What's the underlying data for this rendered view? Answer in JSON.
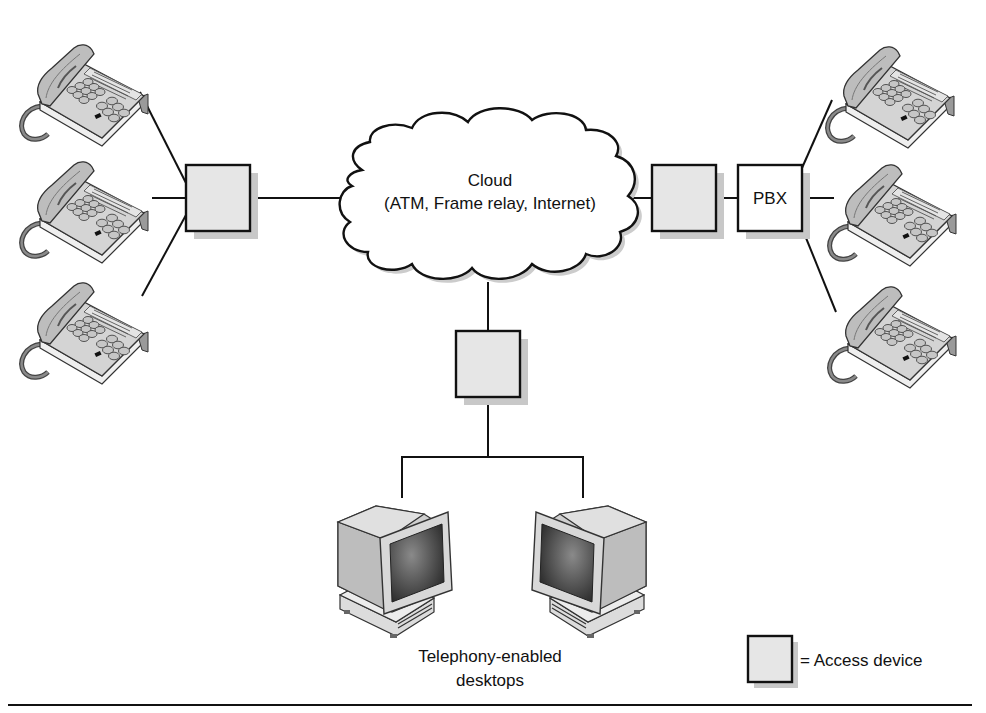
{
  "figure": {
    "cloud": {
      "title": "Cloud",
      "subtitle": "(ATM, Frame relay, Internet)"
    },
    "pbx": {
      "label": "PBX"
    },
    "desktops_caption": {
      "line1": "Telephony-enabled",
      "line2": "desktops"
    },
    "legend": {
      "symbol": "access-device-box",
      "text": "= Access device"
    },
    "left_group": {
      "phones": [
        {
          "name": "phone-1",
          "icon": "telephone-icon"
        },
        {
          "name": "phone-2",
          "icon": "telephone-icon"
        },
        {
          "name": "phone-3",
          "icon": "telephone-icon"
        }
      ],
      "access_device": "access-device"
    },
    "right_group": {
      "phones": [
        {
          "name": "phone-1",
          "icon": "telephone-icon"
        },
        {
          "name": "phone-2",
          "icon": "telephone-icon"
        },
        {
          "name": "phone-3",
          "icon": "telephone-icon"
        }
      ],
      "access_device": "access-device",
      "switch": "PBX"
    },
    "bottom_group": {
      "access_device": "access-device",
      "desktops": [
        {
          "name": "desktop-1",
          "icon": "computer-icon"
        },
        {
          "name": "desktop-2",
          "icon": "computer-icon"
        }
      ]
    },
    "colors": {
      "line": "#111111",
      "access_device_fill": "#e6e6e6",
      "shadow": "#c8c8c8",
      "phone_body": "#d9d9d9",
      "background": "#ffffff"
    }
  }
}
